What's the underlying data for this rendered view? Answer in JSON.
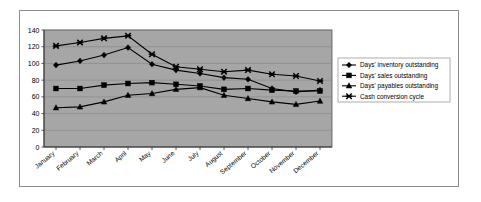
{
  "chart_data": {
    "type": "line",
    "title": "",
    "xlabel": "",
    "ylabel": "",
    "ylim": [
      0,
      140
    ],
    "yticks": [
      0,
      20,
      40,
      60,
      80,
      100,
      120,
      140
    ],
    "grid": true,
    "grid_axis": "y",
    "legend_position": "right",
    "plot_background": "#a6a6a6",
    "categories": [
      "January",
      "February",
      "March",
      "April",
      "May",
      "June",
      "July",
      "August",
      "September",
      "October",
      "November",
      "December"
    ],
    "series": [
      {
        "name": "Days' inventory outstanding",
        "marker": "diamond",
        "color": "#000000",
        "values": [
          98,
          103,
          110,
          119,
          99,
          92,
          88,
          83,
          81,
          70,
          66,
          68
        ]
      },
      {
        "name": "Days' sales outstanding",
        "marker": "square",
        "color": "#000000",
        "values": [
          70,
          70,
          74,
          76,
          77,
          75,
          73,
          69,
          70,
          68,
          67,
          67
        ]
      },
      {
        "name": "Days' payables outstanding",
        "marker": "triangle",
        "color": "#000000",
        "values": [
          47,
          48,
          54,
          62,
          64,
          69,
          71,
          62,
          58,
          54,
          51,
          55
        ]
      },
      {
        "name": "Cash conversion cycle",
        "marker": "cross",
        "color": "#000000",
        "values": [
          121,
          125,
          130,
          133,
          111,
          96,
          93,
          90,
          92,
          87,
          85,
          79
        ]
      }
    ]
  },
  "legend": {
    "entries": [
      "Days' inventory outstanding",
      "Days' sales outstanding",
      "Days' payables outstanding",
      "Cash conversion cycle"
    ]
  },
  "axis": {
    "y_tick_labels": [
      "140",
      "120",
      "100",
      "80",
      "60",
      "40",
      "20",
      "0"
    ]
  }
}
